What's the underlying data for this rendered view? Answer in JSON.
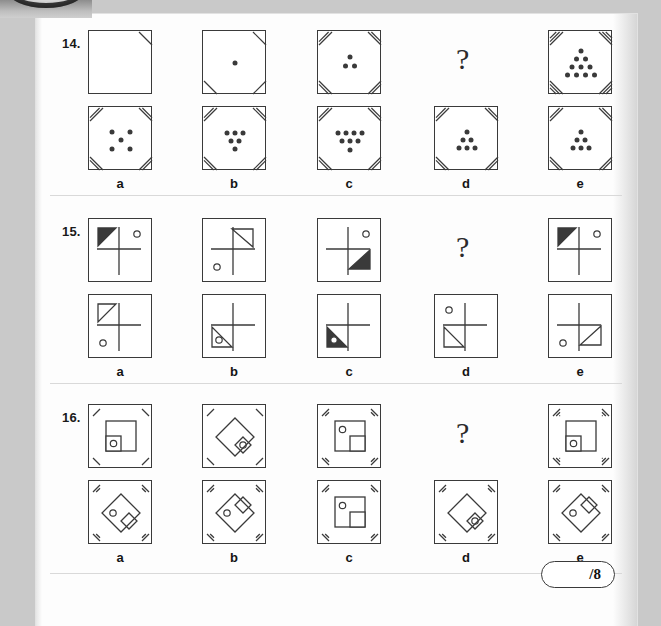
{
  "page": {
    "sheet_background": "#fdfdfd",
    "desk_background": "#c9c9c9",
    "ink_color": "#3a3a3a",
    "score_label": "/8"
  },
  "binder": {
    "name": "binder-ring"
  },
  "option_labels": [
    "a",
    "b",
    "c",
    "d",
    "e"
  ],
  "question_mark": "?",
  "questions": [
    {
      "number": "14.",
      "type": "dot-count-corner-hatch",
      "sequence": [
        {
          "dots": 0,
          "dot_pattern": "none",
          "hatch": 1,
          "hatch_corners": [
            "tr"
          ]
        },
        {
          "dots": 1,
          "dot_pattern": "single-center",
          "hatch": 1,
          "hatch_corners": [
            "tr",
            "bl",
            "br"
          ]
        },
        {
          "dots": 3,
          "dot_pattern": "triangle-3",
          "hatch": 2,
          "hatch_corners": [
            "tl",
            "tr",
            "bl",
            "br"
          ]
        },
        {
          "dots": null,
          "dot_pattern": "question",
          "hatch": 0,
          "hatch_corners": []
        },
        {
          "dots": 10,
          "dot_pattern": "triangle-10",
          "hatch": 3,
          "hatch_corners": [
            "tl",
            "tr",
            "bl",
            "br"
          ]
        }
      ],
      "options": [
        {
          "label": "a",
          "dots": 5,
          "dot_pattern": "quincunx-5",
          "hatch": 2,
          "hatch_corners": [
            "tl",
            "tr",
            "bl",
            "br"
          ]
        },
        {
          "label": "b",
          "dots": 6,
          "dot_pattern": "inv-triangle-3-2-1",
          "hatch": 2,
          "hatch_corners": [
            "tl",
            "tr",
            "bl",
            "br"
          ]
        },
        {
          "label": "c",
          "dots": 8,
          "dot_pattern": "inv-triangle-4-3-1",
          "hatch": 2,
          "hatch_corners": [
            "tl",
            "tr",
            "bl",
            "br"
          ]
        },
        {
          "label": "d",
          "dots": 6,
          "dot_pattern": "triangle-1-2-3",
          "hatch": 2,
          "hatch_corners": [
            "tl",
            "tr",
            "bl",
            "br"
          ]
        },
        {
          "label": "e",
          "dots": 6,
          "dot_pattern": "triangle-1-2-3",
          "hatch": 2,
          "hatch_corners": [
            "tl",
            "tr",
            "bl",
            "br"
          ]
        }
      ]
    },
    {
      "number": "15.",
      "type": "crosshair-triangle-circle",
      "sequence": [
        {
          "triangle": "tl-filled",
          "circle": "tr",
          "cross": "offset"
        },
        {
          "triangle": "tr-outline",
          "circle": "bl",
          "cross": "offset"
        },
        {
          "triangle": "br-filled",
          "circle": "tr",
          "cross": "offset"
        },
        {
          "triangle": "question",
          "circle": "none",
          "cross": "none"
        },
        {
          "triangle": "tl-filled",
          "circle": "tr",
          "cross": "offset"
        }
      ],
      "options": [
        {
          "label": "a",
          "triangle": "tl-outline",
          "circle": "bl",
          "cross": "offset"
        },
        {
          "label": "b",
          "triangle": "bl-outline",
          "circle": "in-triangle",
          "cross": "offset"
        },
        {
          "label": "c",
          "triangle": "bl-filled",
          "circle": "in-triangle-white",
          "cross": "offset"
        },
        {
          "label": "d",
          "triangle": "bl-outline",
          "circle": "tl",
          "cross": "offset"
        },
        {
          "label": "e",
          "triangle": "br-outline",
          "circle": "bl",
          "cross": "offset"
        }
      ]
    },
    {
      "number": "16.",
      "type": "square-diamond-corner-ticks",
      "sequence": [
        {
          "shape": "square-upright",
          "small": "bl",
          "circle_in": "small",
          "ticks": 1
        },
        {
          "shape": "diamond",
          "small": "br",
          "circle_in": "small",
          "ticks": 1
        },
        {
          "shape": "square-upright",
          "small": "br",
          "circle_in": "big",
          "ticks": 2
        },
        {
          "shape": "question",
          "small": "none",
          "circle_in": "none",
          "ticks": 0
        },
        {
          "shape": "square-upright",
          "small": "bl",
          "circle_in": "small",
          "ticks": 3
        }
      ],
      "options": [
        {
          "label": "a",
          "shape": "diamond",
          "small": "br",
          "circle_in": "big",
          "ticks": 2
        },
        {
          "label": "b",
          "shape": "diamond",
          "small": "tr",
          "circle_in": "big",
          "ticks": 2
        },
        {
          "label": "c",
          "shape": "square-upright",
          "small": "br",
          "circle_in": "big",
          "ticks": 2
        },
        {
          "label": "d",
          "shape": "diamond",
          "small": "br",
          "circle_in": "small",
          "ticks": 2
        },
        {
          "label": "e",
          "shape": "diamond",
          "small": "tr",
          "circle_in": "big",
          "ticks": 2
        }
      ]
    }
  ]
}
